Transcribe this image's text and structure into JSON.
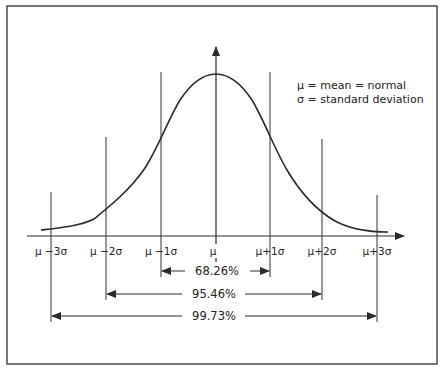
{
  "legend": {
    "line1": "μ = mean = normal",
    "line2": "σ = standard deviation"
  },
  "axis_labels": [
    {
      "id": "m3",
      "text": "μ −3σ"
    },
    {
      "id": "m2",
      "text": "μ −2σ"
    },
    {
      "id": "m1",
      "text": "μ −1σ"
    },
    {
      "id": "mu",
      "text": "μ"
    },
    {
      "id": "p1",
      "text": "μ+1σ"
    },
    {
      "id": "p2",
      "text": "μ+2σ"
    },
    {
      "id": "p3",
      "text": "μ+3σ"
    }
  ],
  "ranges": [
    {
      "label": "68.26%",
      "from": "μ −1σ",
      "to": "μ+1σ"
    },
    {
      "label": "95.46%",
      "from": "μ −2σ",
      "to": "μ+2σ"
    },
    {
      "label": "99.73%",
      "from": "μ −3σ",
      "to": "μ+3σ"
    }
  ],
  "colors": {
    "line": "#2a2a2a",
    "frame": "#4a4a4a",
    "background": "#ffffff"
  }
}
